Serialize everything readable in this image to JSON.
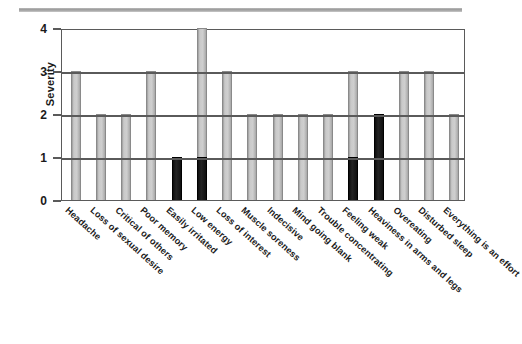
{
  "figure": {
    "top_rule": "horizontal-rule",
    "background_color": "#ffffff"
  },
  "chart_data": {
    "type": "bar",
    "title": "",
    "xlabel": "",
    "ylabel": "Severity",
    "ylim": [
      0,
      4
    ],
    "yticks": [
      "0",
      "1",
      "2",
      "3",
      "4"
    ],
    "grid": true,
    "legend": "none",
    "categories": [
      "Headache",
      "Loss of sexual desire",
      "Critical of others",
      "Poor memory",
      "Easily irritated",
      "Low energy",
      "Loss of interest",
      "Muscle soreness",
      "Indecisive",
      "Mind going blank",
      "Trouble concentrating",
      "Feeling weak",
      "Heaviness in arms and legs",
      "Overeating",
      "Disturbed sleep",
      "Everything is an effort"
    ],
    "values": [
      3,
      2,
      2,
      3,
      1,
      4,
      3,
      2,
      2,
      2,
      2,
      3,
      2,
      3,
      3,
      2
    ],
    "bar_colors": [
      "grey",
      "grey",
      "grey",
      "grey",
      "black",
      "grey",
      "grey",
      "grey",
      "grey",
      "grey",
      "grey",
      "grey",
      "black",
      "grey",
      "grey",
      "grey"
    ],
    "highlight_color": "#111111",
    "bar_color": "#c6c6c6",
    "extra_black_index": 6
  }
}
